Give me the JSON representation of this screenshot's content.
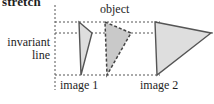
{
  "figure": {
    "title": "stretch",
    "labels": {
      "object": "object",
      "invariant_line_1": "invariant",
      "invariant_line_2": "line",
      "image1": "image 1",
      "image2": "image 2"
    },
    "colors": {
      "stroke": "#555555",
      "fill_light": "#dedede",
      "fill_dark": "#c9c9c9",
      "dash": "#555555",
      "text": "#1e1e1e",
      "background": "#ffffff"
    },
    "geometry": {
      "vertical_guide_x": 55,
      "top_guide_y": 22,
      "invariant_guide_y": 33,
      "bottom_guide_y": 75,
      "image1_triangle": [
        [
          79,
          22
        ],
        [
          92,
          33
        ],
        [
          81,
          75
        ]
      ],
      "object_triangle": [
        [
          105,
          22
        ],
        [
          131,
          33
        ],
        [
          107,
          75
        ]
      ],
      "image2_triangle": [
        [
          155,
          22
        ],
        [
          211,
          33
        ],
        [
          157,
          75
        ]
      ]
    }
  }
}
